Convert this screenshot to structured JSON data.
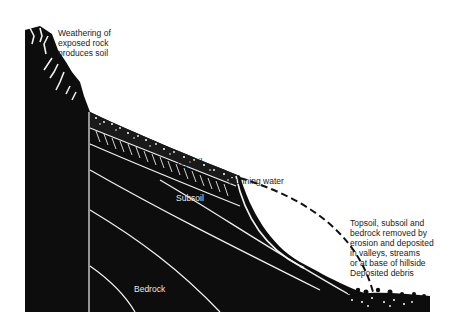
{
  "diagram": {
    "layers": [
      "Topsoil",
      "Subsoil",
      "Bedrock"
    ],
    "labels": {
      "weathering": "Weathering of\nexposed rock\nproduces soil",
      "topsoil": "Topsoil",
      "subsoil": "Subsoil",
      "running_water": "Running water",
      "bedrock": "Bedrock",
      "erosion_note": "Topsoil, subsoil and\nbedrock removed by\nerosion and deposited\nin valleys, streams\nor at base of hillside",
      "deposited_debris": "Deposited debris"
    },
    "colors": {
      "rock": "#0d0d0d",
      "background": "#ffffff",
      "lines": "#f2f2f2"
    }
  }
}
